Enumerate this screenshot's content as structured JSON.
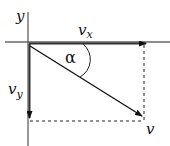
{
  "diagram": {
    "type": "vector-decomposition",
    "labels": {
      "y_axis": "y",
      "vx_main": "v",
      "vx_sub": "x",
      "vy_main": "v",
      "vy_sub": "y",
      "angle": "α",
      "v": "v"
    },
    "colors": {
      "axis": "#555555",
      "vector": "#111111",
      "dashed": "#222222",
      "background": "#ffffff"
    }
  }
}
